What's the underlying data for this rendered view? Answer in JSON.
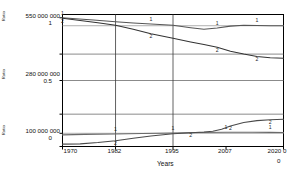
{
  "chart_data": {
    "type": "line",
    "title": "",
    "xlabel": "Years",
    "ylabel": "",
    "grid": true,
    "legend": "inline-labels",
    "x": [
      1970,
      1982,
      1995,
      2007,
      2020
    ],
    "xlim": [
      1970,
      2020
    ],
    "xticklabels": [
      "1970",
      "1982",
      "1995",
      "2007",
      "2020"
    ],
    "left_axis_ticks": [
      {
        "big": "550 000 000",
        "small": "1"
      },
      {
        "big": "280 000 000",
        "small": "0.5"
      },
      {
        "big": "100 000 000",
        "small": "0"
      }
    ],
    "right_axis_ticks": [
      "0",
      "0"
    ],
    "ylim": [
      0,
      1
    ],
    "vertical_axis_labels": [
      "Ratio",
      "Ratio",
      "Ratio"
    ],
    "series": [
      {
        "name": "1",
        "group": "upper",
        "label": "1",
        "color": "#555555",
        "points": [
          [
            1970,
            0.975
          ],
          [
            1973,
            0.968
          ],
          [
            1977,
            0.958
          ],
          [
            1982,
            0.945
          ],
          [
            1986,
            0.936
          ],
          [
            1990,
            0.928
          ],
          [
            1995,
            0.918
          ],
          [
            1999,
            0.9
          ],
          [
            2002,
            0.888
          ],
          [
            2005,
            0.898
          ],
          [
            2008,
            0.912
          ],
          [
            2011,
            0.918
          ],
          [
            2014,
            0.916
          ],
          [
            2017,
            0.915
          ],
          [
            2020,
            0.915
          ]
        ]
      },
      {
        "name": "2",
        "group": "upper",
        "label": "2",
        "color": "#333333",
        "points": [
          [
            1970,
            0.972
          ],
          [
            1974,
            0.955
          ],
          [
            1978,
            0.938
          ],
          [
            1982,
            0.918
          ],
          [
            1986,
            0.888
          ],
          [
            1990,
            0.855
          ],
          [
            1995,
            0.82
          ],
          [
            1999,
            0.792
          ],
          [
            2002,
            0.772
          ],
          [
            2005,
            0.752
          ],
          [
            2008,
            0.722
          ],
          [
            2011,
            0.7
          ],
          [
            2014,
            0.682
          ],
          [
            2017,
            0.672
          ],
          [
            2020,
            0.668
          ]
        ]
      },
      {
        "name": "1",
        "group": "lower",
        "label": "1",
        "color": "#6a6a6a",
        "points": [
          [
            1970,
            0.088
          ],
          [
            1975,
            0.092
          ],
          [
            1982,
            0.095
          ],
          [
            1988,
            0.098
          ],
          [
            1995,
            0.102
          ],
          [
            2001,
            0.106
          ],
          [
            2007,
            0.108
          ],
          [
            2013,
            0.108
          ],
          [
            2017,
            0.107
          ],
          [
            2020,
            0.106
          ]
        ]
      },
      {
        "name": "2",
        "group": "lower",
        "label": "2",
        "color": "#4a4a4a",
        "points": [
          [
            1970,
            0.018
          ],
          [
            1974,
            0.02
          ],
          [
            1978,
            0.03
          ],
          [
            1982,
            0.044
          ],
          [
            1986,
            0.062
          ],
          [
            1990,
            0.08
          ],
          [
            1995,
            0.096
          ],
          [
            1999,
            0.104
          ],
          [
            2002,
            0.11
          ],
          [
            2004,
            0.116
          ],
          [
            2006,
            0.13
          ],
          [
            2008,
            0.155
          ],
          [
            2011,
            0.182
          ],
          [
            2014,
            0.196
          ],
          [
            2017,
            0.202
          ],
          [
            2020,
            0.206
          ]
        ]
      }
    ]
  }
}
